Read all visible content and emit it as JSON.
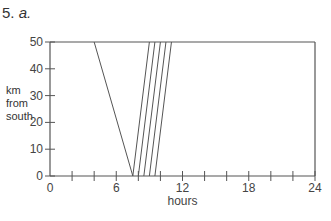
{
  "problem": {
    "number": "5.",
    "part": "a."
  },
  "chart_data": {
    "type": "line",
    "title": "",
    "xlabel": "hours",
    "ylabel": "km from south",
    "ylabel_lines": [
      "km",
      "from",
      "south"
    ],
    "xlim": [
      0,
      24
    ],
    "ylim": [
      0,
      50
    ],
    "xticks_labeled": [
      0,
      6,
      12,
      18,
      24
    ],
    "xticks_minor_step": 2,
    "yticks": [
      0,
      10,
      20,
      30,
      40,
      50
    ],
    "grid": false,
    "frame": "top and right border lines at y=50 and x=24",
    "series": [
      {
        "name": "southbound",
        "points": [
          [
            4,
            50
          ],
          [
            7.5,
            0
          ]
        ]
      },
      {
        "name": "northbound-1",
        "points": [
          [
            7.5,
            0
          ],
          [
            9,
            50
          ]
        ]
      },
      {
        "name": "northbound-2",
        "points": [
          [
            8,
            0
          ],
          [
            9.5,
            50
          ]
        ]
      },
      {
        "name": "northbound-3",
        "points": [
          [
            8.5,
            0
          ],
          [
            10,
            50
          ]
        ]
      },
      {
        "name": "northbound-4",
        "points": [
          [
            9,
            0
          ],
          [
            10.5,
            50
          ]
        ]
      },
      {
        "name": "northbound-5",
        "points": [
          [
            9.5,
            0
          ],
          [
            11,
            50
          ]
        ]
      }
    ],
    "line_color": "#555555"
  }
}
